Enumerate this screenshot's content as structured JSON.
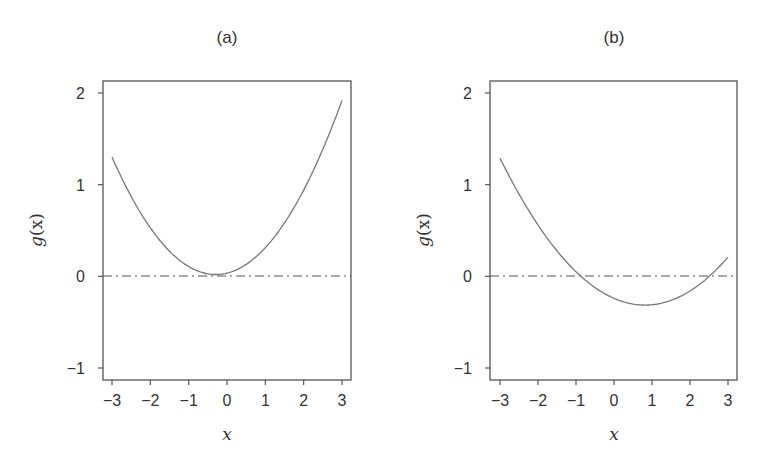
{
  "chart_data": [
    {
      "type": "line",
      "title": "(a)",
      "xlabel": "x",
      "ylabel": "g(x)",
      "xlim": [
        -3.2,
        3.2
      ],
      "ylim": [
        -1.1,
        2.1
      ],
      "xticks": [
        -3,
        -2,
        -1,
        0,
        1,
        2,
        3
      ],
      "yticks": [
        -1,
        0,
        1,
        2
      ],
      "xtick_labels": [
        "−3",
        "−2",
        "−1",
        "0",
        "1",
        "2",
        "3"
      ],
      "ytick_labels": [
        "−1",
        "0",
        "1",
        "2"
      ],
      "grid": false,
      "reference_line": {
        "y": 0,
        "style": "dash-dot"
      },
      "series": [
        {
          "name": "g(x)",
          "description": "convex parabola, minimum ~0.02 near x=-0.3, stays above zero",
          "coefficients_quadratic": [
            0.035,
            0.103,
            0.175
          ],
          "x": [
            -3,
            -2.5,
            -2,
            -1.5,
            -1,
            -0.5,
            0,
            0.5,
            1,
            1.5,
            2,
            2.5,
            3
          ],
          "y": [
            1.3,
            0.88,
            0.53,
            0.28,
            0.11,
            0.03,
            0.04,
            0.13,
            0.31,
            0.57,
            0.94,
            1.38,
            1.92
          ]
        }
      ]
    },
    {
      "type": "line",
      "title": "(b)",
      "xlabel": "x",
      "ylabel": "g(x)",
      "xlim": [
        -3.2,
        3.2
      ],
      "ylim": [
        -1.1,
        2.1
      ],
      "xticks": [
        -3,
        -2,
        -1,
        0,
        1,
        2,
        3
      ],
      "yticks": [
        -1,
        0,
        1,
        2
      ],
      "xtick_labels": [
        "−3",
        "−2",
        "−1",
        "0",
        "1",
        "2",
        "3"
      ],
      "ytick_labels": [
        "−1",
        "0",
        "1",
        "2"
      ],
      "grid": false,
      "reference_line": {
        "y": 0,
        "style": "dash-dot"
      },
      "series": [
        {
          "name": "g(x)",
          "description": "convex parabola, minimum ~-0.31 near x=0.8, crosses zero near x=-0.9 and x=2.5",
          "coefficients_quadratic": [
            -0.24,
            -0.18,
            0.11
          ],
          "x": [
            -3,
            -2.5,
            -2,
            -1.5,
            -1,
            -0.5,
            0,
            0.5,
            1,
            1.5,
            2,
            2.5,
            3
          ],
          "y": [
            1.29,
            0.9,
            0.56,
            0.28,
            0.05,
            -0.12,
            -0.24,
            -0.3,
            -0.31,
            -0.26,
            -0.16,
            0.0,
            0.21
          ]
        }
      ]
    }
  ],
  "panels": [
    {
      "title": "(a)",
      "ylabel_g": "g",
      "ylabel_paren": "(x)",
      "xlabel": "x"
    },
    {
      "title": "(b)",
      "ylabel_g": "g",
      "ylabel_paren": "(x)",
      "xlabel": "x"
    }
  ]
}
